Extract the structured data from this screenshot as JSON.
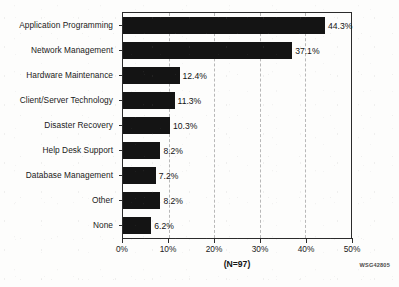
{
  "chart_data": {
    "type": "bar",
    "orientation": "horizontal",
    "title": "",
    "xlabel": "",
    "ylabel": "",
    "categories": [
      "Application Programming",
      "Network Management",
      "Hardware Maintenance",
      "Client/Server Technology",
      "Disaster Recovery",
      "Help Desk Support",
      "Database Management",
      "Other",
      "None"
    ],
    "values": [
      44.3,
      37.1,
      12.4,
      11.3,
      10.3,
      8.2,
      7.2,
      8.2,
      6.2
    ],
    "value_labels": [
      "44.3%",
      "37.1%",
      "12.4%",
      "11.3%",
      "10.3%",
      "8.2%",
      "7.2%",
      "8.2%",
      "6.2%"
    ],
    "xlim": [
      0,
      50
    ],
    "xticks": [
      0,
      10,
      20,
      30,
      40,
      50
    ],
    "xticklabels": [
      "0%",
      "10%",
      "20%",
      "30%",
      "40%",
      "50%"
    ],
    "grid": "vertical-dashed",
    "legend": "none",
    "bar_color": "#141414",
    "caption": "(N=97)",
    "corner_code": "WSG42805"
  }
}
